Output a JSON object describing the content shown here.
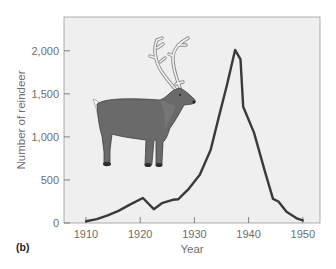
{
  "chart_data": {
    "type": "line",
    "title": "",
    "panel_label": "(b)",
    "xlabel": "Year",
    "ylabel": "Number of reindeer",
    "xlim": [
      1906,
      1952
    ],
    "ylim": [
      0,
      2350
    ],
    "xticks": [
      1910,
      1920,
      1930,
      1940,
      1950
    ],
    "xtick_labels": [
      "1910",
      "1920",
      "1930",
      "1940",
      "1950"
    ],
    "yticks": [
      0,
      500,
      1000,
      1500,
      2000
    ],
    "ytick_labels": [
      "0",
      "500",
      "1,000",
      "1,500",
      "2,000"
    ],
    "grid": false,
    "legend": null,
    "annotations": [
      "reindeer illustration"
    ],
    "series": [
      {
        "name": "Reindeer population",
        "color": "#3a3a3a",
        "x": [
          1910,
          1912,
          1914,
          1916,
          1918,
          1920.5,
          1922.5,
          1924,
          1926,
          1927,
          1929,
          1931,
          1933,
          1934.5,
          1936,
          1937.5,
          1938.5,
          1939,
          1941,
          1943,
          1944.5,
          1945.5,
          1947,
          1949,
          1950
        ],
        "y": [
          20,
          45,
          90,
          140,
          210,
          290,
          160,
          230,
          270,
          275,
          400,
          560,
          850,
          1230,
          1600,
          2010,
          1900,
          1350,
          1050,
          600,
          280,
          250,
          130,
          50,
          30
        ]
      }
    ]
  },
  "colors": {
    "plot_background": "#efefef",
    "axis": "#555555",
    "line": "#3a3a3a",
    "text": "#6e6e6e"
  }
}
